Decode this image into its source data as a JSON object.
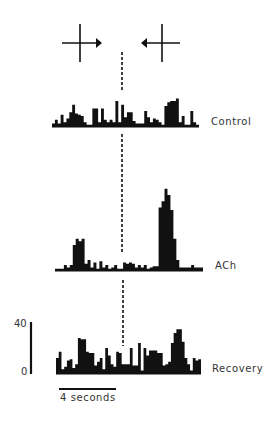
{
  "chart_data": {
    "type": "bar",
    "title": "",
    "stimulus": {
      "left_symbol": "cross with right arrow",
      "right_symbol": "cross with left arrow",
      "divider": "dashed vertical line marking direction reversal"
    },
    "xlabel": "",
    "ylabel": "",
    "scale_bar": {
      "y_max_label": "40",
      "y_min_label": "0",
      "time_label": "4 seconds"
    },
    "ylim": [
      0,
      40
    ],
    "series": [
      {
        "name": "Control",
        "values": [
          2,
          5,
          2,
          9,
          3,
          6,
          11,
          17,
          10,
          9,
          8,
          3,
          1,
          1,
          14,
          14,
          3,
          14,
          5,
          3,
          5,
          3,
          20,
          3,
          17,
          7,
          11,
          11,
          4,
          2,
          2,
          2,
          12,
          7,
          3,
          6,
          5,
          3,
          1,
          16,
          19,
          20,
          20,
          22,
          3,
          8,
          1,
          1,
          12,
          3,
          1
        ]
      },
      {
        "name": "ACh",
        "values": [
          1,
          1,
          0,
          4,
          2,
          4,
          20,
          25,
          23,
          25,
          5,
          8,
          2,
          6,
          1,
          7,
          2,
          4,
          1,
          2,
          4,
          1,
          1,
          6,
          5,
          6,
          5,
          2,
          4,
          2,
          4,
          1,
          2,
          3,
          3,
          50,
          55,
          65,
          60,
          48,
          25,
          8,
          2,
          2,
          2,
          2,
          4,
          2,
          2,
          2
        ]
      },
      {
        "name": "Recovery",
        "values": [
          12,
          17,
          3,
          5,
          10,
          11,
          4,
          7,
          28,
          27,
          27,
          17,
          16,
          16,
          6,
          9,
          12,
          3,
          20,
          14,
          7,
          5,
          17,
          16,
          7,
          7,
          7,
          20,
          6,
          6,
          24,
          2,
          20,
          14,
          18,
          18,
          18,
          16,
          16,
          6,
          7,
          9,
          24,
          32,
          35,
          35,
          25,
          12,
          7,
          2,
          12,
          10,
          11
        ]
      }
    ],
    "annotations": [
      "Control",
      "ACh",
      "Recovery",
      "40",
      "0",
      "4 seconds"
    ]
  },
  "labels": {
    "control": "Control",
    "ach": "ACh",
    "recovery": "Recovery",
    "y_max": "40",
    "y_min": "0",
    "time_scale": "4 seconds"
  },
  "colors": {
    "ink": "#111111",
    "text": "#333333",
    "background": "#ffffff"
  }
}
